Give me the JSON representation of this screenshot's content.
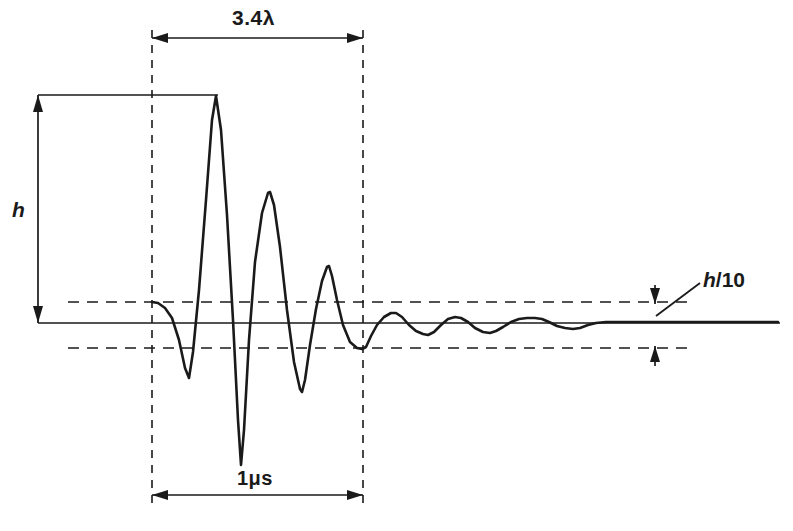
{
  "figure": {
    "labels": {
      "pulse_length": "3.4λ",
      "duration": "1μs",
      "amplitude": "h",
      "threshold_prefix": "h",
      "threshold_suffix": "/10"
    },
    "colors": {
      "line": "#1a1a1a",
      "axis": "#1a1a1a",
      "dashed": "#1a1a1a",
      "background": "#ffffff"
    }
  },
  "chart_data": {
    "type": "line",
    "title": "",
    "xlabel": "",
    "ylabel": "",
    "xlim": [
      0,
      793
    ],
    "ylim": [
      531,
      0
    ],
    "grid": false,
    "legend": false,
    "baseline_y": 323,
    "annotations": [
      {
        "name": "pulse-length-dimension",
        "text": "3.4λ",
        "x_from": 152,
        "x_to": 363,
        "y": 38
      },
      {
        "name": "duration-dimension",
        "text": "1μs",
        "x_from": 152,
        "x_to": 363,
        "y": 495
      },
      {
        "name": "amplitude-dimension",
        "text": "h",
        "x": 38,
        "y_from": 95,
        "y_to": 323
      },
      {
        "name": "threshold-annotation",
        "text": "h/10",
        "x": 655,
        "y_from": 302,
        "y_to": 348
      }
    ],
    "reference_lines": [
      {
        "name": "zero-axis",
        "orientation": "horizontal",
        "y": 323,
        "x_from": 38,
        "x_to": 780,
        "style": "solid"
      },
      {
        "name": "upper-threshold",
        "orientation": "horizontal",
        "y": 302,
        "x_from": 68,
        "x_to": 690,
        "style": "dashed"
      },
      {
        "name": "lower-threshold",
        "orientation": "horizontal",
        "y": 348,
        "x_from": 68,
        "x_to": 690,
        "style": "dashed"
      },
      {
        "name": "pulse-start-marker",
        "orientation": "vertical",
        "x": 152,
        "y_from": 30,
        "y_to": 505,
        "style": "dashed"
      },
      {
        "name": "pulse-end-marker",
        "orientation": "vertical",
        "x": 363,
        "y_from": 30,
        "y_to": 505,
        "style": "dashed"
      },
      {
        "name": "peak-level-line",
        "orientation": "horizontal",
        "y": 95,
        "x_from": 38,
        "x_to": 218,
        "style": "solid"
      }
    ],
    "waveform_points": [
      [
        152,
        302
      ],
      [
        158,
        303
      ],
      [
        165,
        308
      ],
      [
        172,
        318
      ],
      [
        179,
        340
      ],
      [
        185,
        368
      ],
      [
        189,
        378
      ],
      [
        193,
        352
      ],
      [
        199,
        290
      ],
      [
        206,
        200
      ],
      [
        212,
        120
      ],
      [
        216,
        96
      ],
      [
        221,
        130
      ],
      [
        227,
        215
      ],
      [
        233,
        320
      ],
      [
        238,
        420
      ],
      [
        241,
        465
      ],
      [
        244,
        430
      ],
      [
        249,
        340
      ],
      [
        255,
        262
      ],
      [
        262,
        213
      ],
      [
        268,
        193
      ],
      [
        270,
        192
      ],
      [
        274,
        205
      ],
      [
        280,
        247
      ],
      [
        287,
        310
      ],
      [
        294,
        362
      ],
      [
        300,
        389
      ],
      [
        302,
        392
      ],
      [
        305,
        380
      ],
      [
        310,
        345
      ],
      [
        316,
        309
      ],
      [
        322,
        281
      ],
      [
        327,
        267
      ],
      [
        329,
        266
      ],
      [
        332,
        276
      ],
      [
        337,
        300
      ],
      [
        343,
        325
      ],
      [
        350,
        342
      ],
      [
        357,
        348
      ],
      [
        362,
        349
      ],
      [
        366,
        347
      ],
      [
        371,
        336
      ],
      [
        377,
        325
      ],
      [
        384,
        317
      ],
      [
        391,
        313
      ],
      [
        396,
        313
      ],
      [
        402,
        317
      ],
      [
        409,
        325
      ],
      [
        416,
        331
      ],
      [
        423,
        334
      ],
      [
        428,
        335
      ],
      [
        434,
        332
      ],
      [
        441,
        325
      ],
      [
        448,
        319
      ],
      [
        455,
        317
      ],
      [
        461,
        318
      ],
      [
        468,
        322
      ],
      [
        475,
        328
      ],
      [
        483,
        332
      ],
      [
        490,
        333
      ],
      [
        496,
        331
      ],
      [
        503,
        327
      ],
      [
        511,
        322
      ],
      [
        519,
        319
      ],
      [
        527,
        318
      ],
      [
        535,
        318
      ],
      [
        542,
        319
      ],
      [
        549,
        322
      ],
      [
        557,
        326
      ],
      [
        565,
        328
      ],
      [
        573,
        329
      ],
      [
        580,
        328
      ],
      [
        588,
        325
      ],
      [
        596,
        323
      ],
      [
        606,
        322
      ],
      [
        616,
        322
      ],
      [
        626,
        322
      ],
      [
        640,
        322
      ],
      [
        660,
        322
      ],
      [
        690,
        322
      ],
      [
        720,
        322
      ],
      [
        750,
        322
      ],
      [
        778,
        322
      ]
    ]
  }
}
